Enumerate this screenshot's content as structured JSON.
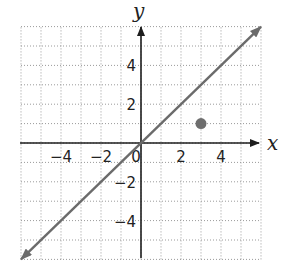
{
  "chart_data": {
    "type": "line",
    "title": "",
    "xlabel": "x",
    "ylabel": "y",
    "xlim": [
      -6,
      6
    ],
    "ylim": [
      -6,
      6
    ],
    "grid": true,
    "grid_style": "dotted",
    "x_ticks": [
      -4,
      -2,
      0,
      2,
      4
    ],
    "y_ticks": [
      4,
      2,
      -2,
      -4
    ],
    "x_tick_labels": [
      "−4",
      "−2",
      "0",
      "2",
      "4"
    ],
    "y_tick_labels": [
      "4",
      "2",
      "−2",
      "−4"
    ],
    "series": [
      {
        "name": "line y = x",
        "type": "line",
        "x": [
          -6,
          6
        ],
        "y": [
          -6,
          6
        ],
        "arrows": "both",
        "color": "#6b6b6b"
      },
      {
        "name": "point",
        "type": "scatter",
        "x": [
          3
        ],
        "y": [
          1
        ],
        "color": "#6e6e6e"
      }
    ]
  },
  "colors": {
    "axis": "#1e1e1e",
    "grid": "#9a9a9a",
    "line": "#6b6b6b",
    "point": "#6e6e6e"
  }
}
